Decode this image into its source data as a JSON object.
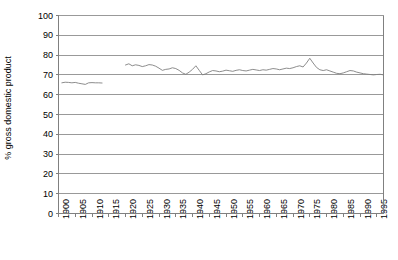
{
  "chart_data": {
    "type": "line",
    "title": "",
    "xlabel": "",
    "ylabel": "% gross domestic product",
    "ylim": [
      0,
      100
    ],
    "xlim": [
      1900,
      1997
    ],
    "grid": true,
    "grid_axis": "y",
    "legend": "none",
    "line_color": "#808080",
    "grid_color": "#999999",
    "frame_color": "#808080",
    "y_ticks": [
      0,
      10,
      20,
      30,
      40,
      50,
      60,
      70,
      80,
      90,
      100
    ],
    "y_tick_labels": [
      "0",
      "10",
      "20",
      "30",
      "40",
      "50",
      "60",
      "70",
      "80",
      "90",
      "100"
    ],
    "x_ticks": [
      1900,
      1905,
      1910,
      1915,
      1920,
      1925,
      1930,
      1935,
      1940,
      1945,
      1950,
      1955,
      1960,
      1965,
      1970,
      1975,
      1980,
      1985,
      1990,
      1995
    ],
    "x_tick_labels": [
      "1900",
      "1905",
      "1910",
      "1915",
      "1920",
      "1925",
      "1930",
      "1935",
      "1940",
      "1945",
      "1950",
      "1955",
      "1960",
      "1965",
      "1970",
      "1975",
      "1980",
      "1985",
      "1990",
      "1995"
    ],
    "series": [
      {
        "name": "series-1-early",
        "x": [
          1901,
          1902,
          1903,
          1904,
          1905,
          1906,
          1907,
          1908,
          1909,
          1910,
          1911,
          1912,
          1913
        ],
        "values": [
          66.0,
          66.3,
          66.2,
          66.0,
          66.2,
          65.8,
          65.5,
          65.2,
          66.0,
          66.1,
          66.0,
          66.0,
          65.9
        ]
      },
      {
        "name": "series-1-main",
        "x": [
          1920,
          1921,
          1922,
          1923,
          1924,
          1925,
          1926,
          1927,
          1928,
          1929,
          1930,
          1931,
          1932,
          1933,
          1934,
          1935,
          1936,
          1937,
          1938,
          1939,
          1940,
          1941,
          1942,
          1943,
          1944,
          1945,
          1946,
          1947,
          1948,
          1949,
          1950,
          1951,
          1952,
          1953,
          1954,
          1955,
          1956,
          1957,
          1958,
          1959,
          1960,
          1961,
          1962,
          1963,
          1964,
          1965,
          1966,
          1967,
          1968,
          1969,
          1970,
          1971,
          1972,
          1973,
          1974,
          1975,
          1976,
          1977,
          1978,
          1979,
          1980,
          1981,
          1982,
          1983,
          1984,
          1985,
          1986,
          1987,
          1988,
          1989,
          1990,
          1991,
          1992,
          1993,
          1994,
          1995,
          1996,
          1997
        ],
        "values": [
          75.0,
          75.6,
          74.6,
          75.1,
          74.8,
          74.2,
          74.6,
          75.2,
          75.0,
          74.4,
          73.4,
          72.3,
          72.8,
          73.0,
          73.6,
          73.2,
          72.3,
          71.0,
          70.3,
          71.4,
          72.8,
          74.6,
          72.3,
          70.0,
          70.6,
          71.5,
          72.2,
          72.0,
          71.6,
          71.9,
          72.4,
          72.1,
          71.8,
          72.3,
          72.6,
          72.2,
          72.0,
          72.4,
          72.8,
          72.5,
          72.2,
          72.6,
          72.4,
          72.8,
          73.2,
          73.0,
          72.6,
          73.0,
          73.4,
          73.2,
          73.6,
          74.2,
          74.6,
          74.0,
          76.0,
          78.4,
          76.0,
          73.8,
          72.6,
          72.2,
          72.6,
          72.0,
          71.4,
          70.8,
          70.6,
          71.0,
          71.6,
          72.2,
          72.0,
          71.4,
          71.0,
          70.6,
          70.4,
          70.2,
          70.0,
          70.2,
          70.3,
          70.0
        ]
      }
    ]
  },
  "axis": {
    "y_title": "% gross domestic product"
  }
}
